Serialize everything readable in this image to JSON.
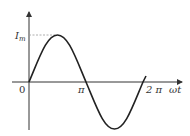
{
  "diagram": {
    "type": "sine-wave",
    "y_axis_label": "I",
    "y_axis_label_sub": "m",
    "origin_label": "0",
    "x_ticks": [
      {
        "label": "π"
      },
      {
        "label": "2 π"
      }
    ],
    "x_axis_label": "ωt",
    "colors": {
      "curve": "#222222",
      "axes": "#333333",
      "guide": "#999999"
    }
  }
}
